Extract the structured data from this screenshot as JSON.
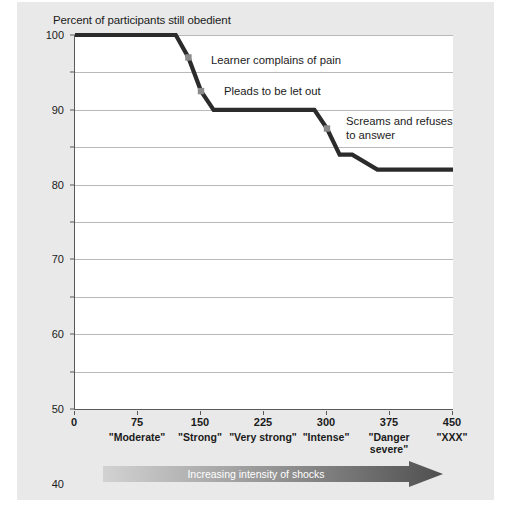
{
  "chart_data": {
    "type": "line",
    "title": "Percent of participants still obedient",
    "xlabel": "Increasing intensity of shocks",
    "ylabel": "Percent of participants still obedient",
    "xlim": [
      0,
      450
    ],
    "ylim": [
      0,
      100
    ],
    "grid": true,
    "legend": "none",
    "x_ticks": [
      0,
      75,
      150,
      225,
      300,
      375,
      450
    ],
    "x_tick_labels": [
      "0",
      "75",
      "150",
      "225",
      "300",
      "375",
      "450"
    ],
    "x_tick_categories": [
      "",
      "\"Moderate\"",
      "\"Strong\"",
      "\"Very\nstrong\"",
      "\"Intense\"",
      "\"Danger\nsevere\"",
      "\"XXX\""
    ],
    "y_ticks": [
      0,
      10,
      20,
      30,
      40,
      50,
      60,
      70,
      80,
      90,
      100
    ],
    "y_tick_labels": [
      "0",
      "10",
      "20",
      "30",
      "40",
      "50",
      "60",
      "70",
      "80",
      "90",
      "100"
    ],
    "series": [
      {
        "name": "Percent still obedient",
        "color": "#2b2b2b",
        "x": [
          0,
          120,
          135,
          150,
          165,
          255,
          285,
          300,
          315,
          330,
          360,
          450
        ],
        "values": [
          100,
          100,
          94,
          85,
          80,
          80,
          80,
          75,
          68,
          68,
          64,
          64
        ]
      }
    ],
    "annotations": [
      {
        "text": "Learner complains of pain",
        "marker_x": 135,
        "marker_y": 94,
        "marker_color": "#8a8a8a"
      },
      {
        "text": "Pleads to be let out",
        "marker_x": 150,
        "marker_y": 85,
        "marker_color": "#8a8a8a"
      },
      {
        "text": "Screams and refuses\nto answer",
        "marker_x": 300,
        "marker_y": 75,
        "marker_color": "#8a8a8a"
      }
    ]
  },
  "figure": {
    "background_color": "#e9e9e9",
    "plot_background_color": "#ffffff",
    "axis_color": "#5a5a5a",
    "gridline_color": "#b9b9b9",
    "line_color": "#2b2b2b",
    "marker_color": "#8a8a8a"
  },
  "arrow_banner": {
    "label": "Increasing intensity of shocks",
    "gradient_start": "#d2d2d2",
    "gradient_end": "#4f4f4f",
    "text_color": "#ffffff"
  },
  "annotation_texts": {
    "a0": "Learner complains of pain",
    "a1": "Pleads to be let out",
    "a2": "Screams and refuses\nto answer"
  }
}
